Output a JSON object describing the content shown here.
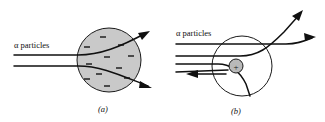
{
  "figure": {
    "title_absent": true,
    "panels": [
      {
        "id": "a",
        "caption": "(a)",
        "model": "plum-pudding",
        "alpha_label": "α particles",
        "sphere": {
          "cx": 109,
          "cy": 60,
          "r": 32,
          "fill": "#c9c9c9",
          "stroke": "#1a1a1a"
        },
        "electron_dash_count": 11,
        "incoming_ray_count": 2,
        "outgoing_arrow_count": 2
      },
      {
        "id": "b",
        "caption": "(b)",
        "model": "nuclear-rutherford",
        "alpha_label": "α particles",
        "atom_circle": {
          "cx": 242,
          "cy": 66,
          "r": 30,
          "fill": "none",
          "stroke": "#1a1a1a"
        },
        "nucleus": {
          "cx": 236,
          "cy": 66,
          "r": 7,
          "fill": "#b9b9b9",
          "stroke": "#1a1a1a",
          "charge_symbol": "+"
        },
        "incoming_ray_count": 4,
        "outgoing_arrow_count": 3,
        "backscattered_arrow_count": 1
      }
    ],
    "colors": {
      "background": "#ffffff",
      "ink": "#101010",
      "sphere_fill": "#c9c9c9",
      "nucleus_fill": "#b9b9b9",
      "electron_dash": "#2b2b2b"
    }
  }
}
